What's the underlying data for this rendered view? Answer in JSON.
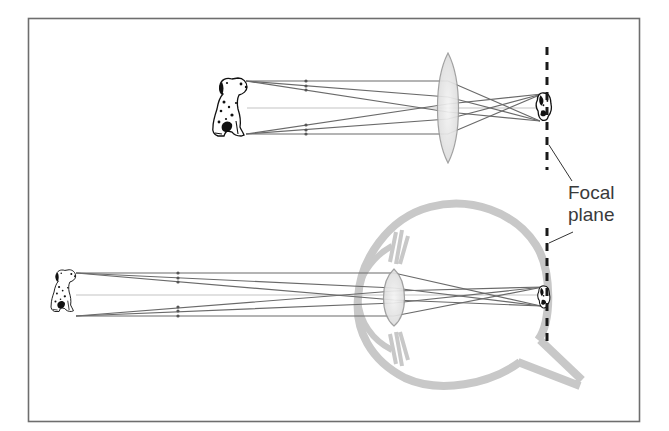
{
  "figure": {
    "type": "optics-diagram",
    "colors": {
      "frame": "#6e6e6e",
      "rays": "#6a6a6a",
      "axis_ray": "#c4c4c4",
      "lens_fill": "#e6e6e6",
      "lens_stroke": "#9a9a9a",
      "eye_tissue": "#c8c8c8",
      "focal_plane": "#1a1a1a",
      "text": "#3a3a3a"
    }
  },
  "labels": {
    "focal_plane_line1": "Focal",
    "focal_plane_line2": "plane"
  },
  "panels": [
    {
      "name": "lens-panel",
      "object": "dalmatian-dog",
      "optic": "convex-lens",
      "image": "inverted-dog-image"
    },
    {
      "name": "eye-panel",
      "object": "dalmatian-dog",
      "optic": "human-eye",
      "image": "inverted-dog-image-on-retina"
    }
  ]
}
